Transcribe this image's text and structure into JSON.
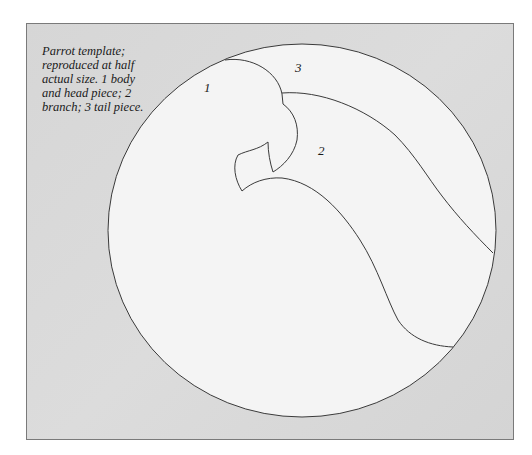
{
  "caption": {
    "lines": [
      "Parrot template;",
      "reproduced at half",
      "actual size. 1 body",
      "and head piece; 2",
      "branch; 3 tail piece."
    ]
  },
  "labels": {
    "body": "1",
    "branch": "2",
    "tail": "3"
  },
  "colors": {
    "background": "#ffffff",
    "frame_fill": "#d8d8d8",
    "frame_border": "#7a7a7a",
    "circle_fill": "#f4f4f4",
    "stroke": "#3a3a3a"
  }
}
